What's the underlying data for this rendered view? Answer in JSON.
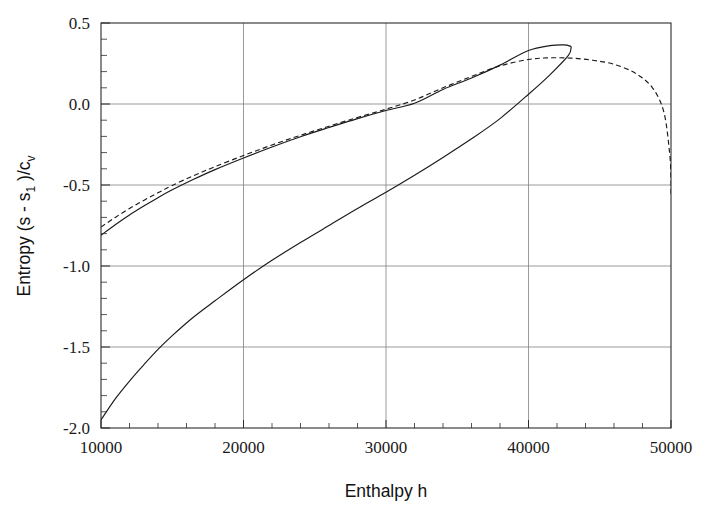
{
  "chart_data": {
    "type": "line",
    "title": "",
    "xlabel": "Enthalpy h",
    "ylabel_parts": {
      "pre": "Entropy (s - s",
      "sub1": "1",
      "mid": " )/c",
      "sub2": "v"
    },
    "ylabel": "Entropy (s - s1 )/cv",
    "xlim": [
      10000,
      50000
    ],
    "ylim": [
      -2.0,
      0.5
    ],
    "xticks": [
      10000,
      20000,
      30000,
      40000,
      50000
    ],
    "xtick_labels": [
      "10000",
      "20000",
      "30000",
      "40000",
      "50000"
    ],
    "yticks": [
      0.5,
      0.0,
      -0.5,
      -1.0,
      -1.5,
      -2.0
    ],
    "ytick_labels": [
      "0.5",
      "0.0",
      "-0.5",
      "-1.0",
      "-1.5",
      "-2.0"
    ],
    "x_minor_tick_interval": 2000,
    "y_minor_tick_interval": 0.1,
    "grid": "major gridlines on both axes, thin gray",
    "legend": "none",
    "line_color": "#1a1a1a",
    "grid_color": "#808080",
    "series": [
      {
        "name": "upper-branch-solid",
        "style": "solid",
        "x": [
          10000,
          11000,
          12000,
          13000,
          14000,
          15000,
          16500,
          18000,
          20000,
          22000,
          24000,
          26000,
          28000,
          30000,
          32000,
          34000,
          36000,
          38000,
          40000,
          41500,
          42500,
          43000
        ],
        "y": [
          -0.81,
          -0.745,
          -0.685,
          -0.63,
          -0.578,
          -0.53,
          -0.465,
          -0.405,
          -0.333,
          -0.265,
          -0.202,
          -0.145,
          -0.09,
          -0.04,
          0.005,
          0.09,
          0.16,
          0.24,
          0.33,
          0.36,
          0.365,
          0.355
        ]
      },
      {
        "name": "lower-branch-solid",
        "style": "solid",
        "x": [
          10000,
          11000,
          12000,
          13000,
          14000,
          15000,
          16500,
          18000,
          20000,
          22000,
          24000,
          26000,
          28000,
          30000,
          32000,
          34000,
          36000,
          38000,
          40000,
          41500,
          42800,
          43000
        ],
        "y": [
          -1.95,
          -1.82,
          -1.71,
          -1.61,
          -1.515,
          -1.43,
          -1.315,
          -1.215,
          -1.085,
          -0.965,
          -0.855,
          -0.75,
          -0.645,
          -0.545,
          -0.44,
          -0.33,
          -0.215,
          -0.09,
          0.06,
          0.18,
          0.3,
          0.355
        ]
      },
      {
        "name": "dashed-curve",
        "style": "dashed",
        "x": [
          10000,
          11000,
          12000,
          13000,
          14000,
          15000,
          16500,
          18000,
          20000,
          22000,
          24000,
          26000,
          28000,
          30000,
          32000,
          34000,
          36000,
          38000,
          40000,
          41500,
          43000,
          44500,
          46000,
          47500,
          48700,
          49500,
          49900,
          50000,
          50000
        ],
        "y": [
          -0.76,
          -0.7,
          -0.645,
          -0.595,
          -0.548,
          -0.503,
          -0.442,
          -0.387,
          -0.318,
          -0.253,
          -0.193,
          -0.137,
          -0.083,
          -0.032,
          0.025,
          0.1,
          0.17,
          0.235,
          0.275,
          0.285,
          0.283,
          0.27,
          0.245,
          0.19,
          0.1,
          -0.05,
          -0.3,
          -0.46,
          -0.56
        ]
      }
    ],
    "annotations": [
      {
        "text": "solid curve turns back near h = 43000 forming a thin loop with the lower branch",
        "visible": false
      }
    ]
  },
  "figure": {
    "plot_area": {
      "left": 101,
      "top": 23,
      "right": 671,
      "bottom": 428
    }
  }
}
